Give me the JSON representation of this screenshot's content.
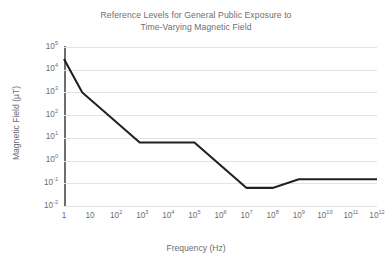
{
  "chart_data": {
    "type": "line",
    "title": "Reference Levels for General Public Exposure to Time-Varying Magnetic Field",
    "title_line1": "Reference Levels for General Public Exposure to",
    "title_line2": "Time-Varying Magnetic Field",
    "xlabel": "Frequency (Hz)",
    "ylabel": "Magnetic Field (µT)",
    "xscale": "log",
    "yscale": "log",
    "xlim": [
      1,
      1000000000000
    ],
    "ylim": [
      0.01,
      100000
    ],
    "grid": "horizontal",
    "legend": "none",
    "xticks": [
      {
        "value": 1,
        "mantissa": "1",
        "exponent": ""
      },
      {
        "value": 10,
        "mantissa": "10",
        "exponent": ""
      },
      {
        "value": 100,
        "mantissa": "10",
        "exponent": "2"
      },
      {
        "value": 1000,
        "mantissa": "10",
        "exponent": "3"
      },
      {
        "value": 10000,
        "mantissa": "10",
        "exponent": "4"
      },
      {
        "value": 100000,
        "mantissa": "10",
        "exponent": "5"
      },
      {
        "value": 1000000,
        "mantissa": "10",
        "exponent": "6"
      },
      {
        "value": 10000000,
        "mantissa": "10",
        "exponent": "7"
      },
      {
        "value": 100000000,
        "mantissa": "10",
        "exponent": "8"
      },
      {
        "value": 1000000000,
        "mantissa": "10",
        "exponent": "9"
      },
      {
        "value": 10000000000,
        "mantissa": "10",
        "exponent": "10"
      },
      {
        "value": 100000000000,
        "mantissa": "10",
        "exponent": "11"
      },
      {
        "value": 1000000000000,
        "mantissa": "10",
        "exponent": "12"
      }
    ],
    "yticks": [
      {
        "value": 100000,
        "mantissa": "10",
        "exponent": "5"
      },
      {
        "value": 10000,
        "mantissa": "10",
        "exponent": "4"
      },
      {
        "value": 1000,
        "mantissa": "10",
        "exponent": "3"
      },
      {
        "value": 100,
        "mantissa": "10",
        "exponent": "2"
      },
      {
        "value": 10,
        "mantissa": "10",
        "exponent": "1"
      },
      {
        "value": 1,
        "mantissa": "10",
        "exponent": "0"
      },
      {
        "value": 0.1,
        "mantissa": "10",
        "exponent": "-1"
      },
      {
        "value": 0.01,
        "mantissa": "10",
        "exponent": "-2"
      }
    ],
    "series": [
      {
        "name": "ICNIRP reference level",
        "color": "#231f20",
        "points": [
          {
            "x": 1,
            "y": 30000
          },
          {
            "x": 5,
            "y": 1000
          },
          {
            "x": 800,
            "y": 6.25
          },
          {
            "x": 100000,
            "y": 6.25
          },
          {
            "x": 10000000,
            "y": 0.0625
          },
          {
            "x": 100000000,
            "y": 0.0625
          },
          {
            "x": 1000000000,
            "y": 0.15
          },
          {
            "x": 1000000000000,
            "y": 0.15
          }
        ]
      }
    ]
  },
  "colors": {
    "line": "#231f20",
    "grid": "#e3e3e4",
    "axis": "#6d6e71",
    "text": "#6d6e71",
    "background": "#ffffff"
  }
}
